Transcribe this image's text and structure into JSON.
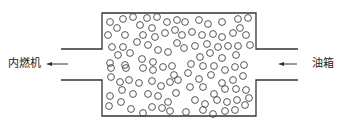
{
  "diagram": {
    "labels": {
      "left": "内燃机",
      "right": "油箱"
    },
    "colors": {
      "stroke": "#333333",
      "background": "#ffffff"
    },
    "chamber": {
      "x": 102,
      "y": 13,
      "width": 154,
      "height": 103
    },
    "left_pipe": {
      "x1": 61,
      "x2": 102,
      "top_y": 49,
      "bottom_y": 80
    },
    "right_pipe": {
      "x1": 256,
      "x2": 298,
      "top_y": 49,
      "bottom_y": 80
    },
    "left_arrow": {
      "from_x": 68,
      "to_x": 46,
      "y": 64
    },
    "right_arrow": {
      "from_x": 297,
      "to_x": 278,
      "y": 64
    },
    "circle_radius": 3.4,
    "circles": [
      [
        110,
        22
      ],
      [
        123,
        19
      ],
      [
        133,
        17
      ],
      [
        147,
        18
      ],
      [
        157,
        17
      ],
      [
        167,
        22
      ],
      [
        177,
        20
      ],
      [
        117,
        28
      ],
      [
        140,
        25
      ],
      [
        152,
        28
      ],
      [
        108,
        35
      ],
      [
        125,
        35
      ],
      [
        143,
        35
      ],
      [
        155,
        37
      ],
      [
        165,
        33
      ],
      [
        175,
        30
      ],
      [
        112,
        47
      ],
      [
        123,
        47
      ],
      [
        137,
        42
      ],
      [
        148,
        45
      ],
      [
        158,
        50
      ],
      [
        168,
        52
      ],
      [
        177,
        43
      ],
      [
        118,
        55
      ],
      [
        130,
        53
      ],
      [
        142,
        59
      ],
      [
        110,
        63
      ],
      [
        125,
        65
      ],
      [
        153,
        62
      ],
      [
        111,
        68
      ],
      [
        126,
        68
      ],
      [
        143,
        68
      ],
      [
        153,
        70
      ],
      [
        163,
        67
      ],
      [
        172,
        66
      ],
      [
        174,
        75
      ],
      [
        111,
        77
      ],
      [
        120,
        82
      ],
      [
        129,
        80
      ],
      [
        139,
        83
      ],
      [
        152,
        81
      ],
      [
        161,
        86
      ],
      [
        170,
        82
      ],
      [
        178,
        80
      ],
      [
        110,
        96
      ],
      [
        122,
        90
      ],
      [
        133,
        94
      ],
      [
        148,
        94
      ],
      [
        158,
        96
      ],
      [
        168,
        102
      ],
      [
        176,
        93
      ],
      [
        109,
        106
      ],
      [
        121,
        102
      ],
      [
        131,
        109
      ],
      [
        143,
        113
      ],
      [
        152,
        107
      ],
      [
        162,
        108
      ],
      [
        170,
        111
      ],
      [
        185,
        22
      ],
      [
        199,
        20
      ],
      [
        208,
        24
      ],
      [
        222,
        22
      ],
      [
        238,
        19
      ],
      [
        248,
        18
      ],
      [
        182,
        35
      ],
      [
        192,
        32
      ],
      [
        202,
        35
      ],
      [
        213,
        34
      ],
      [
        222,
        37
      ],
      [
        233,
        33
      ],
      [
        246,
        35
      ],
      [
        240,
        28
      ],
      [
        184,
        48
      ],
      [
        195,
        46
      ],
      [
        207,
        44
      ],
      [
        218,
        47
      ],
      [
        228,
        46
      ],
      [
        238,
        46
      ],
      [
        250,
        45
      ],
      [
        200,
        57
      ],
      [
        210,
        53
      ],
      [
        222,
        58
      ],
      [
        236,
        55
      ],
      [
        191,
        64
      ],
      [
        203,
        66
      ],
      [
        214,
        66
      ],
      [
        225,
        70
      ],
      [
        235,
        67
      ],
      [
        244,
        65
      ],
      [
        188,
        73
      ],
      [
        199,
        79
      ],
      [
        211,
        75
      ],
      [
        222,
        83
      ],
      [
        233,
        80
      ],
      [
        243,
        76
      ],
      [
        190,
        87
      ],
      [
        203,
        87
      ],
      [
        214,
        94
      ],
      [
        225,
        89
      ],
      [
        236,
        89
      ],
      [
        246,
        90
      ],
      [
        195,
        100
      ],
      [
        205,
        104
      ],
      [
        217,
        100
      ],
      [
        227,
        102
      ],
      [
        237,
        100
      ],
      [
        249,
        98
      ],
      [
        186,
        112
      ],
      [
        203,
        110
      ],
      [
        213,
        114
      ],
      [
        225,
        111
      ],
      [
        235,
        110
      ],
      [
        245,
        105
      ]
    ]
  }
}
